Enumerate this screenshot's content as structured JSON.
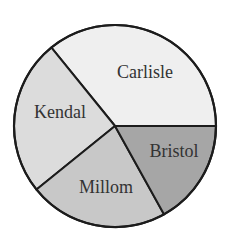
{
  "chart_data": {
    "type": "pie",
    "title": "",
    "categories": [
      "Carlisle",
      "Kendal",
      "Millom",
      "Bristol"
    ],
    "values_degrees": [
      129,
      90,
      80,
      61
    ],
    "values_percent": [
      35.8,
      25.0,
      22.2,
      16.9
    ],
    "colors": [
      "#efefef",
      "#dcdcdc",
      "#c8c8c8",
      "#a6a6a6"
    ],
    "legend": "none (labels inside slices)",
    "start_angle_deg_screen": 0,
    "direction": "slices listed counter-clockwise from east: Carlisle, Kendal, Millom, Bristol",
    "geometry": {
      "cx": 115,
      "cy": 126,
      "r": 101
    },
    "labels": [
      {
        "text": "Carlisle",
        "x": 145,
        "y": 74
      },
      {
        "text": "Kendal",
        "x": 60,
        "y": 114
      },
      {
        "text": "Millom",
        "x": 106,
        "y": 189
      },
      {
        "text": "Bristol",
        "x": 174,
        "y": 153
      }
    ]
  }
}
